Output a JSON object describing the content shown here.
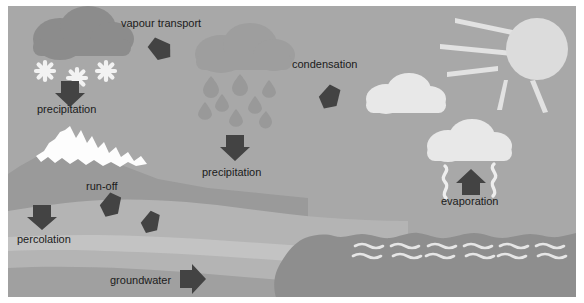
{
  "figure": {
    "width": 584,
    "height": 303,
    "background": "#ffffff"
  },
  "palette": {
    "sky": "#a8a8a8",
    "snow_cloud": "#8c8c8c",
    "rain_cloud": "#9e9e9e",
    "white_cloud": "#e8e8e8",
    "sun": "#dcdcdc",
    "sun_ray": "#e2e2e2",
    "arrow": "#434343",
    "snowflake": "#f2f2f2",
    "raindrop": "#999999",
    "mountain_snow": "#fdfdfd",
    "land_upper": "#9a9a9a",
    "land_mid": "#b4b4b4",
    "aquifer": "#c3c3c3",
    "land_lower": "#a0a0a0",
    "sea": "#8e8e8e",
    "wave_line": "#e6e6e6",
    "vapour_squiggle": "#eeeeee",
    "label_text": "#1b1b1b"
  },
  "labels": {
    "vapour_transport": "vapour transport",
    "precipitation_left": "precipitation",
    "precipitation_mid": "precipitation",
    "condensation": "condensation",
    "evaporation": "evaporation",
    "run_off": "run-off",
    "percolation": "percolation",
    "groundwater": "groundwater"
  },
  "elements": {
    "clouds": [
      {
        "name": "snow-cloud",
        "shade": "dark"
      },
      {
        "name": "rain-cloud",
        "shade": "mid"
      },
      {
        "name": "condensation-cloud",
        "shade": "white"
      },
      {
        "name": "evaporation-cloud",
        "shade": "white"
      }
    ],
    "sun": {
      "name": "sun",
      "rays": 5
    },
    "snowflakes": 3,
    "raindrops": 8,
    "wave_rows": 2,
    "wave_groups": 6,
    "arrows": [
      {
        "name": "vapour-transport-arrow",
        "direction": "right-down"
      },
      {
        "name": "precipitation-left-arrow",
        "direction": "down"
      },
      {
        "name": "precipitation-mid-arrow",
        "direction": "down"
      },
      {
        "name": "condensation-arrow",
        "direction": "left-down"
      },
      {
        "name": "evaporation-arrow",
        "direction": "up"
      },
      {
        "name": "run-off-arrow-1",
        "direction": "down-left"
      },
      {
        "name": "run-off-arrow-2",
        "direction": "down-left"
      },
      {
        "name": "percolation-arrow",
        "direction": "down"
      },
      {
        "name": "groundwater-arrow",
        "direction": "right"
      }
    ]
  }
}
